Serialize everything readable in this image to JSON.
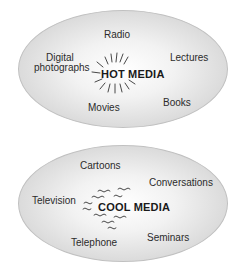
{
  "hot": {
    "title": "HOT MEDIA",
    "items": [
      "Radio",
      "Digital photographs",
      "Lectures",
      "Movies",
      "Books"
    ],
    "digital_line1": "Digital",
    "digital_line2": "photographs"
  },
  "cool": {
    "title": "COOL MEDIA",
    "items": [
      "Cartoons",
      "Conversations",
      "Television",
      "Telephone",
      "Seminars"
    ]
  }
}
